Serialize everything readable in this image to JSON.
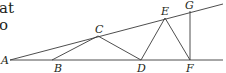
{
  "text_fragments": [
    "at",
    "o"
  ],
  "diagram": {
    "points": {
      "A": {
        "label": "A",
        "x": 10,
        "y": 60
      },
      "B": {
        "label": "B",
        "x": 52,
        "y": 60
      },
      "C": {
        "label": "C",
        "x": 98,
        "y": 36
      },
      "D": {
        "label": "D",
        "x": 141,
        "y": 60
      },
      "E": {
        "label": "E",
        "x": 165,
        "y": 18
      },
      "F": {
        "label": "F",
        "x": 190,
        "y": 60
      },
      "G": {
        "label": "G",
        "x": 190,
        "y": 11
      }
    },
    "segments": [
      [
        "A",
        "baseline-end"
      ],
      [
        "A",
        "ray-end"
      ],
      [
        "B",
        "C"
      ],
      [
        "C",
        "D"
      ],
      [
        "D",
        "E"
      ],
      [
        "E",
        "F"
      ],
      [
        "F",
        "G"
      ]
    ],
    "line_color": "#3a3a3a",
    "label_color": "#231f20"
  }
}
